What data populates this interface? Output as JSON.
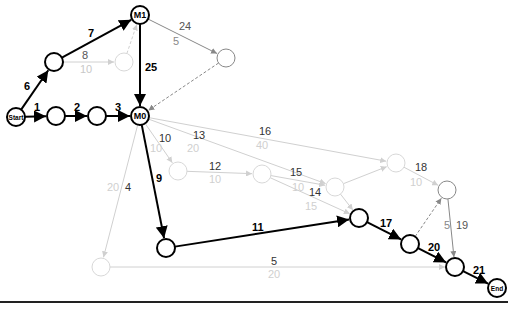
{
  "diagram": {
    "type": "network-activity-diagram",
    "colors": {
      "critical": "#000000",
      "normal": "#888888",
      "faded": "#d0d0d0",
      "faded_text": "#c8c8c8"
    },
    "nodes": [
      {
        "id": "start",
        "label": "Start",
        "x": 16,
        "y": 117,
        "r": 9,
        "style": "critical"
      },
      {
        "id": "n1",
        "label": "",
        "x": 56,
        "y": 116,
        "r": 9,
        "style": "critical"
      },
      {
        "id": "n2",
        "label": "",
        "x": 97,
        "y": 116,
        "r": 9,
        "style": "critical"
      },
      {
        "id": "m0",
        "label": "M0",
        "x": 140,
        "y": 116,
        "r": 9,
        "style": "critical"
      },
      {
        "id": "n6",
        "label": "",
        "x": 54,
        "y": 62,
        "r": 9,
        "style": "critical"
      },
      {
        "id": "m1",
        "label": "M1",
        "x": 140,
        "y": 15,
        "r": 9,
        "style": "critical"
      },
      {
        "id": "n8",
        "label": "",
        "x": 124,
        "y": 62,
        "r": 9,
        "style": "faded"
      },
      {
        "id": "n24",
        "label": "",
        "x": 226,
        "y": 58,
        "r": 9,
        "style": "normal"
      },
      {
        "id": "n10",
        "label": "",
        "x": 178,
        "y": 171,
        "r": 9,
        "style": "faded"
      },
      {
        "id": "n12",
        "label": "",
        "x": 262,
        "y": 174,
        "r": 9,
        "style": "faded"
      },
      {
        "id": "n15",
        "label": "",
        "x": 335,
        "y": 187,
        "r": 9,
        "style": "faded"
      },
      {
        "id": "n16",
        "label": "",
        "x": 396,
        "y": 163,
        "r": 9,
        "style": "faded"
      },
      {
        "id": "n18",
        "label": "",
        "x": 447,
        "y": 190,
        "r": 9,
        "style": "normal"
      },
      {
        "id": "n9",
        "label": "",
        "x": 166,
        "y": 248,
        "r": 9,
        "style": "critical"
      },
      {
        "id": "n17",
        "label": "",
        "x": 359,
        "y": 218,
        "r": 9,
        "style": "critical"
      },
      {
        "id": "n20",
        "label": "",
        "x": 410,
        "y": 244,
        "r": 9,
        "style": "critical"
      },
      {
        "id": "n21",
        "label": "",
        "x": 455,
        "y": 267,
        "r": 9,
        "style": "critical"
      },
      {
        "id": "end",
        "label": "End",
        "x": 497,
        "y": 288,
        "r": 9,
        "style": "critical"
      },
      {
        "id": "n4",
        "label": "",
        "x": 101,
        "y": 267,
        "r": 9,
        "style": "faded"
      }
    ],
    "edges": [
      {
        "from": "start",
        "to": "n1",
        "label": "1",
        "sub": "",
        "style": "critical"
      },
      {
        "from": "n1",
        "to": "n2",
        "label": "2",
        "sub": "",
        "style": "critical"
      },
      {
        "from": "n2",
        "to": "m0",
        "label": "3",
        "sub": "",
        "style": "critical"
      },
      {
        "from": "start",
        "to": "n6",
        "label": "6",
        "sub": "",
        "style": "critical"
      },
      {
        "from": "n6",
        "to": "m1",
        "label": "7",
        "sub": "",
        "style": "critical"
      },
      {
        "from": "n6",
        "to": "n8",
        "label": "8",
        "sub": "10",
        "style": "faded"
      },
      {
        "from": "n8",
        "to": "m1",
        "label": "",
        "sub": "",
        "style": "faded-dashed"
      },
      {
        "from": "m1",
        "to": "m0",
        "label": "25",
        "sub": "",
        "style": "critical"
      },
      {
        "from": "m1",
        "to": "n24",
        "label": "24",
        "sub": "5",
        "style": "normal"
      },
      {
        "from": "n24",
        "to": "m0",
        "label": "",
        "sub": "",
        "style": "normal-dashed"
      },
      {
        "from": "m0",
        "to": "n10",
        "label": "10",
        "sub": "10",
        "style": "faded"
      },
      {
        "from": "m0",
        "to": "n15",
        "label": "13",
        "sub": "20",
        "style": "faded"
      },
      {
        "from": "m0",
        "to": "n16",
        "label": "16",
        "sub": "40",
        "style": "faded"
      },
      {
        "from": "n10",
        "to": "n12",
        "label": "12",
        "sub": "10",
        "style": "faded"
      },
      {
        "from": "n12",
        "to": "n15",
        "label": "15",
        "sub": "10",
        "style": "faded"
      },
      {
        "from": "n12",
        "to": "n17",
        "label": "14",
        "sub": "15",
        "style": "faded"
      },
      {
        "from": "n15",
        "to": "n16",
        "label": "",
        "sub": "",
        "style": "faded"
      },
      {
        "from": "n15",
        "to": "n17",
        "label": "",
        "sub": "",
        "style": "faded"
      },
      {
        "from": "n16",
        "to": "n18",
        "label": "18",
        "sub": "10",
        "style": "faded"
      },
      {
        "from": "n18",
        "to": "n21",
        "label": "19",
        "sub": "5",
        "style": "normal"
      },
      {
        "from": "n20",
        "to": "n18",
        "label": "",
        "sub": "",
        "style": "normal-dashed"
      },
      {
        "from": "m0",
        "to": "n9",
        "label": "9",
        "sub": "",
        "style": "critical"
      },
      {
        "from": "n9",
        "to": "n17",
        "label": "11",
        "sub": "",
        "style": "critical"
      },
      {
        "from": "n17",
        "to": "n20",
        "label": "17",
        "sub": "",
        "style": "critical"
      },
      {
        "from": "n20",
        "to": "n21",
        "label": "20",
        "sub": "",
        "style": "critical"
      },
      {
        "from": "n21",
        "to": "end",
        "label": "21",
        "sub": "",
        "style": "critical"
      },
      {
        "from": "m0",
        "to": "n4",
        "label": "4",
        "sub": "20",
        "style": "faded"
      },
      {
        "from": "n4",
        "to": "n21",
        "label": "5",
        "sub": "20",
        "style": "faded"
      }
    ],
    "labels": [
      {
        "text": "1",
        "x": 34,
        "y": 111,
        "cls": "bold",
        "color": "#000"
      },
      {
        "text": "2",
        "x": 74,
        "y": 111,
        "cls": "bold",
        "color": "#000"
      },
      {
        "text": "3",
        "x": 115,
        "y": 111,
        "cls": "bold",
        "color": "#000"
      },
      {
        "text": "6",
        "x": 24,
        "y": 90,
        "cls": "bold",
        "color": "#000"
      },
      {
        "text": "7",
        "x": 88,
        "y": 37,
        "cls": "bold",
        "color": "#000"
      },
      {
        "text": "8",
        "x": 82,
        "y": 59,
        "cls": "",
        "color": "#555"
      },
      {
        "text": "10",
        "x": 80,
        "y": 73,
        "cls": "",
        "color": "#c8c8c8"
      },
      {
        "text": "25",
        "x": 145,
        "y": 71,
        "cls": "bold",
        "color": "#000"
      },
      {
        "text": "24",
        "x": 179,
        "y": 30,
        "cls": "",
        "color": "#555"
      },
      {
        "text": "5",
        "x": 173,
        "y": 45,
        "cls": "",
        "color": "#888"
      },
      {
        "text": "10",
        "x": 159,
        "y": 142,
        "cls": "",
        "color": "#333"
      },
      {
        "text": "10",
        "x": 150,
        "y": 152,
        "cls": "",
        "color": "#d0d0d0"
      },
      {
        "text": "13",
        "x": 193,
        "y": 139,
        "cls": "",
        "color": "#333"
      },
      {
        "text": "20",
        "x": 187,
        "y": 152,
        "cls": "",
        "color": "#d0d0d0"
      },
      {
        "text": "16",
        "x": 259,
        "y": 135,
        "cls": "",
        "color": "#333"
      },
      {
        "text": "40",
        "x": 256,
        "y": 149,
        "cls": "",
        "color": "#d0d0d0"
      },
      {
        "text": "12",
        "x": 209,
        "y": 170,
        "cls": "",
        "color": "#333"
      },
      {
        "text": "10",
        "x": 209,
        "y": 183,
        "cls": "",
        "color": "#d0d0d0"
      },
      {
        "text": "15",
        "x": 290,
        "y": 176,
        "cls": "",
        "color": "#333"
      },
      {
        "text": "10",
        "x": 292,
        "y": 191,
        "cls": "",
        "color": "#d0d0d0"
      },
      {
        "text": "14",
        "x": 309,
        "y": 196,
        "cls": "",
        "color": "#333"
      },
      {
        "text": "15",
        "x": 305,
        "y": 210,
        "cls": "",
        "color": "#d0d0d0"
      },
      {
        "text": "18",
        "x": 415,
        "y": 171,
        "cls": "",
        "color": "#333"
      },
      {
        "text": "10",
        "x": 410,
        "y": 186,
        "cls": "",
        "color": "#d0d0d0"
      },
      {
        "text": "9",
        "x": 156,
        "y": 182,
        "cls": "bold",
        "color": "#000"
      },
      {
        "text": "4",
        "x": 125,
        "y": 191,
        "cls": "",
        "color": "#333"
      },
      {
        "text": "20",
        "x": 107,
        "y": 191,
        "cls": "",
        "color": "#d0d0d0"
      },
      {
        "text": "11",
        "x": 252,
        "y": 231,
        "cls": "bold",
        "color": "#000"
      },
      {
        "text": "5",
        "x": 271,
        "y": 265,
        "cls": "",
        "color": "#333"
      },
      {
        "text": "20",
        "x": 268,
        "y": 278,
        "cls": "",
        "color": "#d0d0d0"
      },
      {
        "text": "17",
        "x": 380,
        "y": 227,
        "cls": "bold",
        "color": "#000"
      },
      {
        "text": "20",
        "x": 428,
        "y": 251,
        "cls": "bold",
        "color": "#000"
      },
      {
        "text": "21",
        "x": 473,
        "y": 274,
        "cls": "bold",
        "color": "#000"
      },
      {
        "text": "5",
        "x": 444,
        "y": 229,
        "cls": "",
        "color": "#888"
      },
      {
        "text": "19",
        "x": 456,
        "y": 229,
        "cls": "",
        "color": "#555"
      }
    ],
    "baseline": {
      "x1": 0,
      "x2": 508,
      "y": 302
    }
  }
}
